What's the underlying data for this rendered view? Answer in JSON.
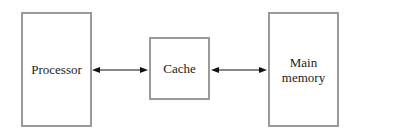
{
  "diagram": {
    "nodes": [
      {
        "id": "processor",
        "label": "Processor"
      },
      {
        "id": "cache",
        "label": "Cache"
      },
      {
        "id": "main_memory",
        "label_line1": "Main",
        "label_line2": "memory"
      }
    ],
    "edges": [
      {
        "from": "processor",
        "to": "cache",
        "type": "bidirectional"
      },
      {
        "from": "cache",
        "to": "main_memory",
        "type": "bidirectional"
      }
    ]
  }
}
